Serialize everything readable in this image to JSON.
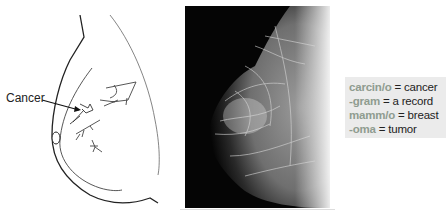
{
  "diagram": {
    "label": "Cancer"
  },
  "mammogram": {
    "description": "Mammogram X-ray image of breast tissue"
  },
  "terms": [
    {
      "root": "carcin/o",
      "eq": " = ",
      "meaning": "cancer"
    },
    {
      "root": "-gram",
      "eq": " = ",
      "meaning": "a record"
    },
    {
      "root": "mamm/o",
      "eq": " = ",
      "meaning": "breast"
    },
    {
      "root": "-oma",
      "eq": " = ",
      "meaning": "tumor"
    }
  ],
  "colors": {
    "root_text": "#8f9c90",
    "box_bg": "#ebebeb",
    "mammo_bg": "#050505"
  }
}
